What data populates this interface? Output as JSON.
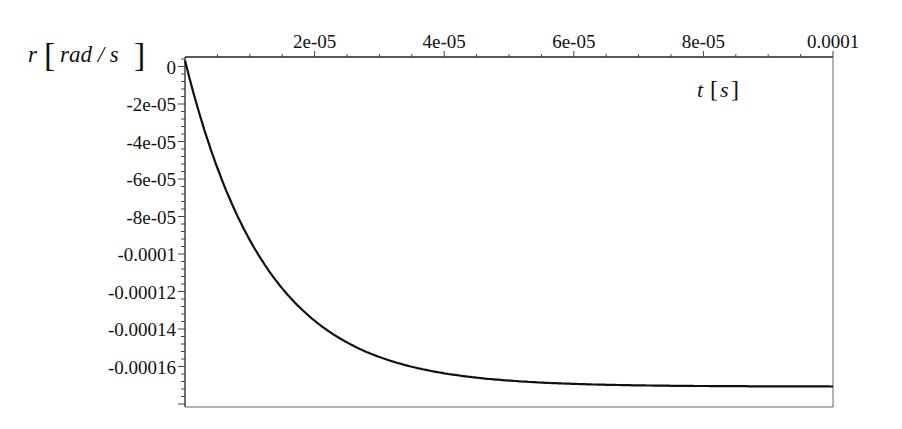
{
  "chart_data": {
    "type": "line",
    "title": "",
    "xlabel": "t [s]",
    "ylabel": "r [rad / s]",
    "xlabel_var": "t",
    "xlabel_unit": "s",
    "ylabel_var": "r",
    "ylabel_unit": "rad / s",
    "xlim": [
      0,
      0.0001
    ],
    "ylim": [
      -0.000184,
      4.8e-06
    ],
    "grid": false,
    "legend": null,
    "x_ticks": [
      {
        "value": 2e-05,
        "label": "2e-05"
      },
      {
        "value": 4e-05,
        "label": "4e-05"
      },
      {
        "value": 6e-05,
        "label": "6e-05"
      },
      {
        "value": 8e-05,
        "label": "8e-05"
      },
      {
        "value": 0.0001,
        "label": "0.0001"
      }
    ],
    "y_ticks": [
      {
        "value": 0,
        "label": "0"
      },
      {
        "value": -2e-05,
        "label": "-2e-05"
      },
      {
        "value": -4e-05,
        "label": "-4e-05"
      },
      {
        "value": -6e-05,
        "label": "-6e-05"
      },
      {
        "value": -8e-05,
        "label": "-8e-05"
      },
      {
        "value": -0.0001,
        "label": "-0.0001"
      },
      {
        "value": -0.00012,
        "label": "-0.00012"
      },
      {
        "value": -0.00014,
        "label": "-0.00014"
      },
      {
        "value": -0.00016,
        "label": "-0.00016"
      }
    ],
    "series": [
      {
        "name": "r(t)",
        "color": "#111111",
        "x": [
          0,
          5e-06,
          1e-05,
          1.5e-05,
          2e-05,
          2.5e-05,
          3e-05,
          4e-05,
          5e-05,
          6e-05,
          7e-05,
          8e-05,
          9e-05,
          0.0001
        ],
        "y": [
          0,
          -5.74e-05,
          -9.58e-05,
          -0.0001215,
          -0.0001388,
          -0.0001503,
          -0.000158,
          -0.0001668,
          -0.0001707,
          -0.0001725,
          -0.0001733,
          -0.0001737,
          -0.0001738,
          -0.0001739
        ]
      }
    ]
  }
}
